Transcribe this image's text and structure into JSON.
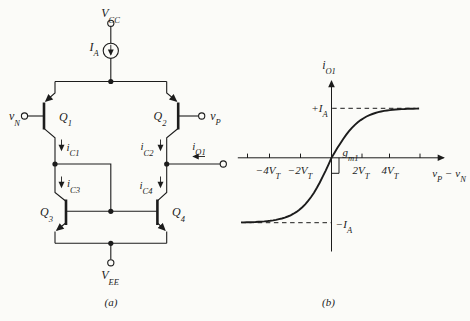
{
  "colors": {
    "ink": "#1c1c1c",
    "paper": "#fbfbf8"
  },
  "figure": {
    "panel_a": {
      "caption": [
        {
          "t": "(a)"
        }
      ],
      "labels": {
        "vcc": [
          {
            "t": "V",
            "s": "CC"
          }
        ],
        "ia": [
          {
            "t": "I",
            "s": "A"
          }
        ],
        "vn": [
          {
            "t": "v",
            "s": "N"
          }
        ],
        "vp": [
          {
            "t": "v",
            "s": "P"
          }
        ],
        "q1": [
          {
            "t": "Q",
            "s": "1"
          }
        ],
        "q2": [
          {
            "t": "Q",
            "s": "2"
          }
        ],
        "q3": [
          {
            "t": "Q",
            "s": "3"
          }
        ],
        "q4": [
          {
            "t": "Q",
            "s": "4"
          }
        ],
        "ic1": [
          {
            "t": "i",
            "s": "C1"
          }
        ],
        "ic2": [
          {
            "t": "i",
            "s": "C2"
          }
        ],
        "ic3": [
          {
            "t": "i",
            "s": "C3"
          }
        ],
        "ic4": [
          {
            "t": "i",
            "s": "C4"
          }
        ],
        "io1": [
          {
            "t": "i",
            "s": "O1"
          }
        ],
        "vee": [
          {
            "t": "V",
            "s": "EE"
          }
        ]
      }
    },
    "panel_b": {
      "caption": [
        {
          "t": "(b)"
        }
      ],
      "labels": {
        "y_axis": [
          {
            "t": "i",
            "s": "O1"
          }
        ],
        "x_axis": [
          {
            "t": "v",
            "s": "P"
          },
          {
            "t": " − "
          },
          {
            "t": "v",
            "s": "N"
          }
        ],
        "plus_ia": [
          {
            "t": "+I",
            "s": "A"
          }
        ],
        "minus_ia": [
          {
            "t": "−I",
            "s": "A"
          }
        ],
        "gm1": [
          {
            "t": "g",
            "s": "m1"
          }
        ],
        "tick_m4": [
          {
            "t": "−4V",
            "s": "T"
          }
        ],
        "tick_m2": [
          {
            "t": "−2V",
            "s": "T"
          }
        ],
        "tick_p2": [
          {
            "t": "2V",
            "s": "T"
          }
        ],
        "tick_p4": [
          {
            "t": "4V",
            "s": "T"
          }
        ]
      },
      "chart_data": {
        "type": "line",
        "title": "",
        "xlabel": "v_P − v_N",
        "ylabel": "i_O1",
        "x_units": "V_T",
        "y_units": "I_A",
        "x_tick_labels": [
          "−4V_T",
          "−2V_T",
          "2V_T",
          "4V_T"
        ],
        "x_ticks_in_VT": [
          -6,
          -4,
          -2,
          2,
          4,
          6
        ],
        "y_ref_lines": [
          {
            "label": "+I_A",
            "value": 1
          },
          {
            "label": "−I_A",
            "value": -1
          }
        ],
        "annotations": [
          {
            "label": "g_m1",
            "meaning": "slope of curve at origin"
          }
        ],
        "function": "i_O1 = I_A · tanh((v_P − v_N) / (2·V_T))",
        "x": [
          -6,
          -5,
          -4,
          -3,
          -2,
          -1,
          0,
          1,
          2,
          3,
          4,
          5,
          6
        ],
        "y": [
          -0.995,
          -0.987,
          -0.964,
          -0.905,
          -0.762,
          -0.462,
          0,
          0.462,
          0.762,
          0.905,
          0.964,
          0.987,
          0.995
        ],
        "xlim": [
          -6.4,
          7.9
        ],
        "ylim": [
          -1.25,
          1.55
        ],
        "grid": false,
        "legend": "none"
      }
    }
  }
}
